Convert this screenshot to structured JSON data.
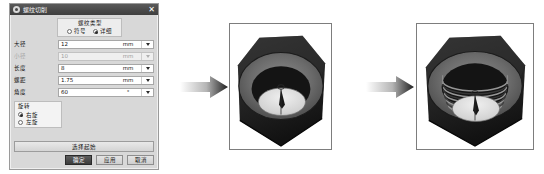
{
  "dialog": {
    "title": "螺纹切削",
    "close_label": "✕",
    "icon_name": "gear-icon",
    "type_group": {
      "title": "螺纹类型",
      "options": [
        {
          "label": "符号",
          "selected": false
        },
        {
          "label": "详细",
          "selected": true
        }
      ]
    },
    "params": [
      {
        "label": "大径",
        "value": "12",
        "unit": "mm",
        "disabled": false
      },
      {
        "label": "小径",
        "value": "10",
        "unit": "mm",
        "disabled": true
      },
      {
        "label": "长度",
        "value": "8",
        "unit": "mm",
        "disabled": false
      },
      {
        "label": "螺距",
        "value": "1.75",
        "unit": "mm",
        "disabled": false
      },
      {
        "label": "角度",
        "value": "60",
        "unit": "°",
        "disabled": false
      }
    ],
    "rotation_group": {
      "title": "旋转",
      "options": [
        {
          "label": "右旋",
          "selected": true
        },
        {
          "label": "左旋",
          "selected": false
        }
      ]
    },
    "apply_all_button": "选择起始",
    "buttons": [
      {
        "label": "确定",
        "primary": true
      },
      {
        "label": "应用",
        "primary": false
      },
      {
        "label": "取消",
        "primary": false
      }
    ]
  },
  "flow": {
    "arrow1_name": "arrow-right-1",
    "arrow2_name": "arrow-right-2",
    "before_image_name": "hex-nut-unthreaded",
    "after_image_name": "hex-nut-threaded"
  },
  "colors": {
    "titlebar": "#4a4a4a",
    "dialog_bg": "#d8d8d8",
    "field_bg": "#ffffff",
    "primary_button": "#4d4d4d",
    "nut_dark": "#2b2b2b",
    "nut_mid": "#6e6e6e",
    "nut_light": "#9a9a9a",
    "bore_light": "#e8e8e8"
  }
}
